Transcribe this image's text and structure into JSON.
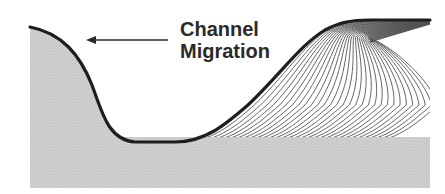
{
  "diagram": {
    "title": "Channel Migration",
    "label_lines": [
      "Channel",
      "Migration"
    ],
    "arrow_direction": "left",
    "colors": {
      "background": "#ffffff",
      "sediment_fill": "#cfcfcf",
      "channel_outline": "#1e1e1e",
      "accretion_lines": "#555555",
      "text": "#2a2a2a"
    },
    "elements": [
      {
        "name": "cut-bank",
        "description": "Eroding outer bank on the left (shaded)"
      },
      {
        "name": "channel-bed",
        "description": "Channel floor outlined by thick dark line"
      },
      {
        "name": "point-bar",
        "description": "Point bar with lateral accretion surfaces on the right"
      },
      {
        "name": "basal-deposit",
        "description": "Shaded basal sediment layer beneath accretion surfaces"
      }
    ],
    "accretion_surface_count": 30
  }
}
